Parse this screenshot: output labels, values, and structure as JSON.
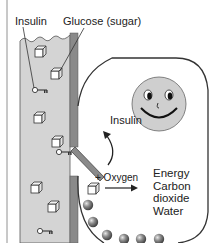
{
  "labels": {
    "insulin_vessel": "Insulin",
    "glucose": "Glucose (sugar)",
    "insulin_cell": "Insulin",
    "oxygen": "+ Oxygen"
  },
  "outputs": [
    "Energy",
    "Carbon",
    "dioxide",
    "Water"
  ],
  "colors": {
    "vessel_fill": "#d4d4d4",
    "vessel_wall": "#8a8a8a",
    "cell_outline": "#333333",
    "face_fill": "#cfcfcf",
    "ball": "#6b6b6b",
    "text": "#222222"
  },
  "icons": {
    "glucose": "sugar-cube-icon",
    "insulin": "key-icon",
    "face": "smiley-face-icon",
    "mitochondria": "sphere-icon"
  }
}
